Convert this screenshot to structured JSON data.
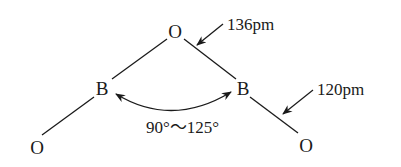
{
  "diagram": {
    "atoms": [
      {
        "id": "o_top",
        "symbol": "O"
      },
      {
        "id": "b_left",
        "symbol": "B"
      },
      {
        "id": "b_right",
        "symbol": "B"
      },
      {
        "id": "o_bottom_left",
        "symbol": "O"
      },
      {
        "id": "o_bottom_right",
        "symbol": "O"
      }
    ],
    "labels": {
      "bond_length_bridge": "136pm",
      "bond_length_terminal": "120pm",
      "angle_range": "90°～125°"
    },
    "colors": {
      "stroke": "#1a1a1a",
      "background": "#ffffff"
    }
  }
}
